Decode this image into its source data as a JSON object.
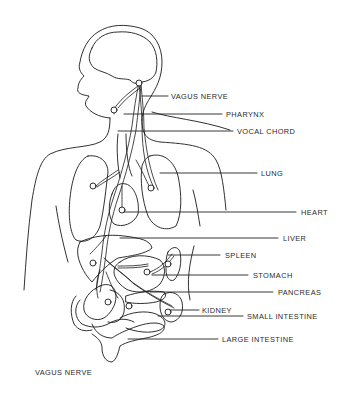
{
  "diagram": {
    "caption": "VAGUS NERVE",
    "labels": [
      {
        "id": "vagus-nerve",
        "text": "VAGUS NERVE",
        "x": 171,
        "y": 93
      },
      {
        "id": "pharynx",
        "text": "PHARYNX",
        "x": 226,
        "y": 111
      },
      {
        "id": "vocal-chord",
        "text": "VOCAL CHORD",
        "x": 237,
        "y": 128
      },
      {
        "id": "lung",
        "text": "LUNG",
        "x": 261,
        "y": 170
      },
      {
        "id": "heart",
        "text": "HEART",
        "x": 301,
        "y": 209
      },
      {
        "id": "liver",
        "text": "LIVER",
        "x": 283,
        "y": 235
      },
      {
        "id": "spleen",
        "text": "SPLEEN",
        "x": 225,
        "y": 252
      },
      {
        "id": "stomach",
        "text": "STOMACH",
        "x": 253,
        "y": 272
      },
      {
        "id": "pancreas",
        "text": "PANCREAS",
        "x": 278,
        "y": 289
      },
      {
        "id": "kidney",
        "text": "KIDNEY",
        "x": 202,
        "y": 307
      },
      {
        "id": "small-intestine",
        "text": "SMALL INTESTINE",
        "x": 247,
        "y": 313
      },
      {
        "id": "large-intestine",
        "text": "LARGE INTESTINE",
        "x": 222,
        "y": 336
      }
    ],
    "stroke_color": "#1a1a1a",
    "background": "#ffffff"
  }
}
